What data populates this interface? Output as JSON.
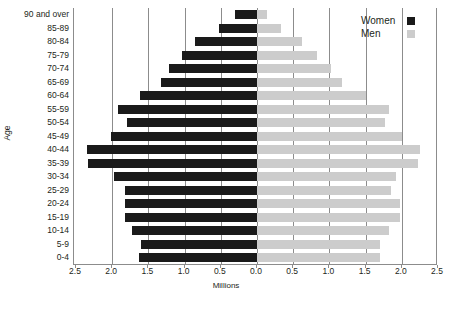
{
  "chart_data": {
    "type": "bar",
    "subtype": "population-pyramid",
    "title": "",
    "xlabel": "Millions",
    "ylabel": "Age",
    "orientation": "horizontal",
    "grid": true,
    "legend_position": "top-right",
    "xlim": [
      -2.5,
      2.5
    ],
    "xticks": [
      2.5,
      2.0,
      1.5,
      1.0,
      0.5,
      0.0,
      0.5,
      1.0,
      1.5,
      2.0,
      2.5
    ],
    "xtick_labels": [
      "2.5",
      "2.0",
      "1.5",
      "1.0",
      "0.5",
      "0.0",
      "0.5",
      "1.0",
      "1.5",
      "2.0",
      "2.5"
    ],
    "categories": [
      "90 and over",
      "85-89",
      "80-84",
      "75-79",
      "70-74",
      "65-69",
      "60-64",
      "55-59",
      "50-54",
      "45-49",
      "40-44",
      "35-39",
      "30-34",
      "25-29",
      "20-24",
      "15-19",
      "10-14",
      "5-9",
      "0-4"
    ],
    "series": [
      {
        "name": "Women",
        "color": "#1a1a1a",
        "side": "left",
        "values": [
          0.3,
          0.53,
          0.86,
          1.03,
          1.22,
          1.32,
          1.62,
          1.92,
          1.8,
          2.02,
          2.35,
          2.33,
          1.97,
          1.83,
          1.83,
          1.83,
          1.72,
          1.6,
          1.63
        ]
      },
      {
        "name": "Men",
        "color": "#cccccc",
        "side": "right",
        "values": [
          0.14,
          0.33,
          0.62,
          0.83,
          1.02,
          1.17,
          1.5,
          1.83,
          1.77,
          2.0,
          2.25,
          2.23,
          1.92,
          1.85,
          1.97,
          1.97,
          1.82,
          1.7,
          1.7
        ]
      }
    ]
  },
  "legend": {
    "items": [
      {
        "label": "Women",
        "swatch": "women"
      },
      {
        "label": "Men",
        "swatch": "men"
      }
    ]
  },
  "axis": {
    "x_title": "Millions",
    "y_title": "Age"
  }
}
